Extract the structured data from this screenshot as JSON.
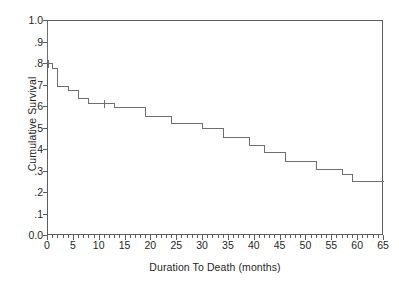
{
  "chart_data": {
    "type": "line",
    "subtype": "kaplan-meier-step",
    "title": "",
    "xlabel": "Duration To Death (months)",
    "ylabel": "Cumulative Survival",
    "xlim": [
      0,
      65
    ],
    "ylim": [
      0,
      1.0
    ],
    "grid": false,
    "legend": "none",
    "x_major_step": 5,
    "x_minor_step": 1,
    "y_major_step": 0.1,
    "xticklabels": [
      "0",
      "5",
      "10",
      "15",
      "20",
      "25",
      "30",
      "35",
      "40",
      "45",
      "50",
      "55",
      "60",
      "65"
    ],
    "xtickvalues": [
      0,
      5,
      10,
      15,
      20,
      25,
      30,
      35,
      40,
      45,
      50,
      55,
      60,
      65
    ],
    "yticklabels": [
      "0.0",
      ".1",
      ".2",
      ".3",
      ".4",
      ".5",
      ".6",
      ".7",
      ".8",
      ".9",
      "1.0"
    ],
    "ytickvalues": [
      0,
      0.1,
      0.2,
      0.3,
      0.4,
      0.5,
      0.6,
      0.7,
      0.8,
      0.9,
      1.0
    ],
    "line_color": "#6e6e6e",
    "frame_color": "#5d5d5d",
    "series": [
      {
        "name": "Cumulative Survival",
        "steps": [
          {
            "x": 0,
            "y": 1.0
          },
          {
            "x": 0,
            "y": 0.8
          },
          {
            "x": 1,
            "y": 0.8
          },
          {
            "x": 1,
            "y": 0.775
          },
          {
            "x": 2,
            "y": 0.775
          },
          {
            "x": 2,
            "y": 0.695
          },
          {
            "x": 4,
            "y": 0.695
          },
          {
            "x": 4,
            "y": 0.675
          },
          {
            "x": 6,
            "y": 0.675
          },
          {
            "x": 6,
            "y": 0.635
          },
          {
            "x": 8,
            "y": 0.635
          },
          {
            "x": 8,
            "y": 0.615
          },
          {
            "x": 13,
            "y": 0.615
          },
          {
            "x": 13,
            "y": 0.595
          },
          {
            "x": 19,
            "y": 0.595
          },
          {
            "x": 19,
            "y": 0.555
          },
          {
            "x": 24,
            "y": 0.555
          },
          {
            "x": 24,
            "y": 0.52
          },
          {
            "x": 30,
            "y": 0.52
          },
          {
            "x": 30,
            "y": 0.5
          },
          {
            "x": 34,
            "y": 0.5
          },
          {
            "x": 34,
            "y": 0.455
          },
          {
            "x": 39,
            "y": 0.455
          },
          {
            "x": 39,
            "y": 0.42
          },
          {
            "x": 42,
            "y": 0.42
          },
          {
            "x": 42,
            "y": 0.385
          },
          {
            "x": 46,
            "y": 0.385
          },
          {
            "x": 46,
            "y": 0.345
          },
          {
            "x": 52,
            "y": 0.345
          },
          {
            "x": 52,
            "y": 0.305
          },
          {
            "x": 57,
            "y": 0.305
          },
          {
            "x": 57,
            "y": 0.285
          },
          {
            "x": 59,
            "y": 0.285
          },
          {
            "x": 59,
            "y": 0.25
          },
          {
            "x": 65,
            "y": 0.25
          }
        ],
        "censor_marks": [
          {
            "x": 0.2,
            "y": 0.8
          },
          {
            "x": 11,
            "y": 0.615
          }
        ]
      }
    ]
  }
}
